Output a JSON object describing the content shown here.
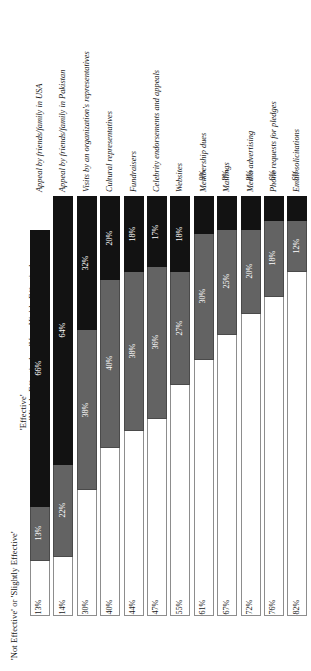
{
  "legend": {
    "not_effective": "'Not Effective' or 'Slightly Effective'",
    "effective": "'Effective'",
    "highly_effective": "'Highly Effective' or 'Very Highly Effective'"
  },
  "colors": {
    "highly_effective": "#121212",
    "effective": "#636363",
    "not_effective": "#ffffff",
    "outline": "#8d8d8d"
  },
  "chart_data": {
    "type": "bar",
    "title": "",
    "xlabel": "",
    "ylabel": "",
    "ylim": [
      0,
      100
    ],
    "stacked": true,
    "orientation": "vertical",
    "grid": false,
    "legend_position": "left",
    "categories": [
      "Appeal by friends/family in USA",
      "Appeal by friends/family in Pakistan",
      "Visits by an organization's representatives",
      "Cultural representatives",
      "Fundraisers",
      "Celebrity endorsements and appeals",
      "Websites",
      "Membership dues",
      "Mailings",
      "Media advertising",
      "Phone requests for pledges",
      "Email solicitations"
    ],
    "series": [
      {
        "name": "'Highly Effective' or 'Very Highly Effective'",
        "color": "#121212",
        "values": [
          66,
          64,
          32,
          20,
          18,
          17,
          18,
          9,
          8,
          8,
          6,
          6
        ],
        "labels": [
          "66%",
          "64%",
          "32%",
          "20%",
          "18%",
          "17%",
          "18%",
          "9%",
          "8%",
          "8%",
          "6%",
          "6%"
        ]
      },
      {
        "name": "'Effective'",
        "color": "#636363",
        "values": [
          13,
          22,
          38,
          40,
          38,
          36,
          27,
          30,
          25,
          20,
          18,
          12
        ],
        "labels": [
          "13%",
          "22%",
          "38%",
          "40%",
          "38%",
          "36%",
          "27%",
          "30%",
          "25%",
          "20%",
          "18%",
          "12%"
        ]
      },
      {
        "name": "'Not Effective' or 'Slightly Effective'",
        "color": "#ffffff",
        "values": [
          13,
          14,
          30,
          40,
          44,
          47,
          55,
          61,
          67,
          72,
          76,
          82
        ],
        "labels": [
          "13%",
          "14%",
          "30%",
          "40%",
          "44%",
          "47%",
          "55%",
          "61%",
          "67%",
          "72%",
          "76%",
          "82%"
        ]
      }
    ]
  }
}
